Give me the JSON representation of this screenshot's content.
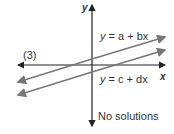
{
  "diagram": {
    "case_label": "(3)",
    "axis_x_label": "x",
    "axis_y_label": "y",
    "line1": {
      "eq_y": "y",
      "eq_mid": " = ",
      "eq_a": "a",
      "eq_plus": " + ",
      "eq_b": "bx"
    },
    "line2": {
      "eq_y": "y",
      "eq_mid": " = ",
      "eq_a": "c",
      "eq_plus": " + ",
      "eq_b": "dx"
    },
    "caption": "No solutions",
    "colors": {
      "axis": "#222222",
      "lines": "#777777",
      "text": "#333333"
    }
  }
}
